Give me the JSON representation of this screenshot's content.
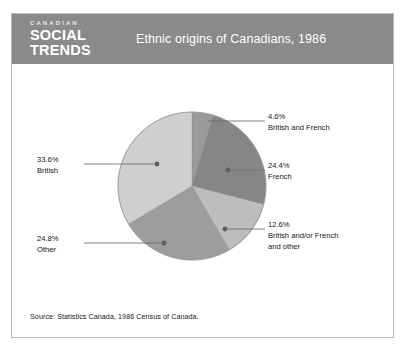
{
  "header": {
    "logo_line1": "CANADIAN",
    "logo_line2": "SOCIAL",
    "logo_line3": "TRENDS",
    "title": "Ethnic origins of Canadians, 1986"
  },
  "footer": {
    "source": "Source: Statistics Canada, 1986 Census of Canada."
  },
  "colors": {
    "header_bg": "#8a8a8a",
    "frame_border": "#b9b9b9",
    "page_bg": "#ffffff",
    "text": "#141414",
    "leader_line": "#6f6f6f",
    "slice_british": "#cfcfcf",
    "slice_british_and_french": "#9a9a9a",
    "slice_french": "#868686",
    "slice_british_andor_french_and_other": "#bdbdbd",
    "slice_other": "#9d9d9d"
  },
  "chart_data": {
    "type": "pie",
    "title": "Ethnic origins of Canadians, 1986",
    "source": "Source: Statistics Canada, 1986 Census of Canada.",
    "grid": false,
    "legend": "callout-labels",
    "unit": "%",
    "categories": [
      "British and French",
      "French",
      "British and/or French and other",
      "Other",
      "British"
    ],
    "values": [
      4.6,
      24.4,
      12.6,
      24.8,
      33.6
    ],
    "slices": [
      {
        "label": "British and French",
        "value_text": "4.6%",
        "value": 4.6,
        "color": "#9a9a9a",
        "label_position": "top-right",
        "label_lines": [
          "4.6%",
          "British and French"
        ]
      },
      {
        "label": "French",
        "value_text": "24.4%",
        "value": 24.4,
        "color": "#868686",
        "label_position": "right",
        "label_lines": [
          "24.4%",
          "French"
        ]
      },
      {
        "label": "British and/or French and other",
        "value_text": "12.6%",
        "value": 12.6,
        "color": "#bdbdbd",
        "label_position": "bottom-right",
        "label_lines": [
          "12.6%",
          "British and/or French",
          "and other"
        ]
      },
      {
        "label": "Other",
        "value_text": "24.8%",
        "value": 24.8,
        "color": "#9d9d9d",
        "label_position": "bottom-left",
        "label_lines": [
          "24.8%",
          "Other"
        ]
      },
      {
        "label": "British",
        "value_text": "33.6%",
        "value": 33.6,
        "color": "#cfcfcf",
        "label_position": "left",
        "label_lines": [
          "33.6%",
          "British"
        ]
      }
    ]
  },
  "labels": {
    "british_and_french": {
      "pct": "4.6%",
      "name": "British and French"
    },
    "french": {
      "pct": "24.4%",
      "name": "French"
    },
    "british_andor_french_and_other": {
      "pct": "12.6%",
      "name_line1": "British and/or French",
      "name_line2": "and other"
    },
    "other": {
      "pct": "24.8%",
      "name": "Other"
    },
    "british": {
      "pct": "33.6%",
      "name": "British"
    }
  }
}
